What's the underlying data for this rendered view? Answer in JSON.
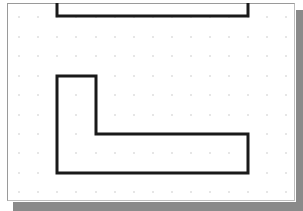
{
  "drawing": {
    "background": "#ffffff",
    "grid_color": "#9a9a9a",
    "line_color": "#1a1a1a",
    "line_width": 3,
    "grid": {
      "x": [
        19,
        38,
        57,
        76,
        96,
        115,
        134,
        153,
        172,
        191,
        210,
        229,
        248,
        267,
        286
      ],
      "y": [
        17,
        37,
        56,
        76,
        95,
        115,
        134,
        153,
        173,
        192
      ]
    },
    "shapes": [
      {
        "name": "top-channel-outline",
        "type": "polyline",
        "points": [
          [
            57,
            3
          ],
          [
            57,
            16
          ],
          [
            248,
            16
          ],
          [
            248,
            3
          ]
        ]
      },
      {
        "name": "l-shape-outline",
        "type": "polygon",
        "points": [
          [
            57,
            76
          ],
          [
            96,
            76
          ],
          [
            96,
            134
          ],
          [
            248,
            134
          ],
          [
            248,
            173
          ],
          [
            57,
            173
          ]
        ]
      }
    ]
  }
}
